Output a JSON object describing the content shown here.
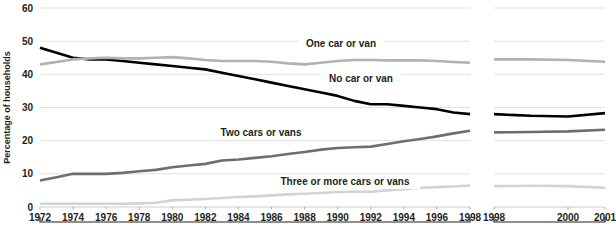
{
  "chart_data": {
    "type": "line",
    "title": "",
    "subtitle": "",
    "xlabel": "",
    "ylabel": "Percentage of households",
    "ylim": [
      0,
      60
    ],
    "yticks": [
      0,
      10,
      20,
      30,
      40,
      50,
      60
    ],
    "ytick_labels": [
      "0",
      "10",
      "20",
      "30",
      "40",
      "50",
      "60"
    ],
    "grid": true,
    "legend_position": "inline-labels",
    "axis_break": {
      "present": true,
      "note": "x-axis is broken between the 1972-1998 panel and the 1998-2001 panel",
      "panel_1_label": "1972 to 1998",
      "panel_2_label": "1998 to 2001"
    },
    "x_panels": [
      {
        "name": "panel-1",
        "x": [
          1972,
          1973,
          1974,
          1975,
          1976,
          1977,
          1978,
          1979,
          1980,
          1981,
          1982,
          1983,
          1984,
          1985,
          1986,
          1987,
          1988,
          1989,
          1990,
          1991,
          1992,
          1993,
          1994,
          1995,
          1996,
          1997,
          1998
        ],
        "tick_values": [
          1972,
          1974,
          1976,
          1978,
          1980,
          1982,
          1984,
          1986,
          1988,
          1990,
          1992,
          1994,
          1996,
          1998
        ],
        "tick_labels": [
          "1972",
          "1974",
          "1976",
          "1978",
          "1980",
          "1982",
          "1984",
          "1986",
          "1988",
          "1990",
          "1992",
          "1994",
          "1996",
          "1998"
        ]
      },
      {
        "name": "panel-2",
        "x": [
          1998,
          1999,
          2000,
          2001
        ],
        "tick_values": [
          1998,
          2000,
          2001
        ],
        "tick_labels": [
          "1998",
          "2000",
          "2001"
        ]
      }
    ],
    "series": [
      {
        "name": "No car or van",
        "label": "No car or van",
        "color": "#000000",
        "width": 2.6,
        "panel_1_values": [
          48,
          46.5,
          45,
          44.5,
          44.5,
          44,
          43.5,
          43,
          42.5,
          42,
          41.5,
          40.5,
          39.5,
          38.5,
          37.5,
          36.5,
          35.5,
          34.5,
          33.5,
          32,
          31,
          31,
          30.5,
          30,
          29.5,
          28.5,
          28
        ],
        "panel_2_values": [
          28,
          27.5,
          27.3,
          28.3
        ]
      },
      {
        "name": "One car or van",
        "label": "One car or van",
        "color": "#b2b2b2",
        "width": 2.6,
        "panel_1_values": [
          43,
          43.7,
          44.5,
          44.8,
          45,
          44.8,
          44.8,
          45,
          45.2,
          44.8,
          44.3,
          44,
          44,
          44,
          43.8,
          43.3,
          43,
          43.5,
          44,
          44.3,
          44.3,
          44.2,
          44.2,
          44.2,
          44,
          43.7,
          43.5
        ],
        "panel_2_values": [
          44.5,
          44.5,
          44.3,
          43.8
        ]
      },
      {
        "name": "Two cars or vans",
        "label": "Two cars or vans",
        "color": "#6e6e6e",
        "width": 2.6,
        "panel_1_values": [
          8,
          9,
          10,
          10,
          10,
          10.3,
          10.8,
          11.2,
          12,
          12.5,
          13,
          14,
          14.3,
          14.8,
          15.3,
          16,
          16.6,
          17.3,
          17.8,
          18,
          18.2,
          19,
          19.8,
          20.5,
          21.3,
          22.2,
          23
        ],
        "panel_2_values": [
          22.5,
          22.6,
          22.8,
          23.3
        ]
      },
      {
        "name": "Three or more cars or vans",
        "label": "Three or more cars or vans",
        "color": "#d3d3d3",
        "width": 2.6,
        "panel_1_values": [
          1,
          1,
          1,
          1,
          1,
          1,
          1.1,
          1.3,
          2,
          2.2,
          2.4,
          2.7,
          3,
          3.2,
          3.5,
          3.8,
          4,
          4.2,
          4.5,
          4.6,
          4.6,
          5,
          5.4,
          5.8,
          6,
          6.2,
          6.5
        ],
        "panel_2_values": [
          6.3,
          6.4,
          6.3,
          5.8
        ]
      }
    ],
    "inline_labels": [
      {
        "text": "One car or van",
        "series": "One car or van",
        "x_px": 341,
        "y_px": 47
      },
      {
        "text": "No car or van",
        "series": "No car or van",
        "x_px": 361,
        "y_px": 82
      },
      {
        "text": "Two cars or vans",
        "series": "Two cars or vans",
        "x_px": 261,
        "y_px": 136
      },
      {
        "text": "Three or more cars or vans",
        "series": "Three or more cars or vans",
        "x_px": 345,
        "y_px": 185
      }
    ]
  }
}
